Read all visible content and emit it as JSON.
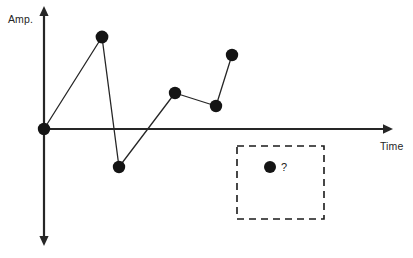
{
  "figure": {
    "name": "amplitude-time-sequence-diagram",
    "background_color": "#ffffff",
    "stroke_color": "#262626",
    "marker_color": "#141414",
    "width": 413,
    "height": 258
  },
  "axes": {
    "y": {
      "label": "Amp.",
      "label_x": 8,
      "label_y": 14,
      "x": 44,
      "top_y": 6,
      "bottom_y": 246,
      "arrow_up": true,
      "arrow_down": true
    },
    "x": {
      "label": "Time",
      "label_x": 380,
      "label_y": 141,
      "y": 129,
      "left_x": 44,
      "right_x": 393,
      "arrow_right": true
    }
  },
  "chart_data": {
    "type": "scatter",
    "title": "",
    "xlabel": "Time",
    "ylabel": "Amp.",
    "grid": false,
    "legend": null,
    "connected": true,
    "marker_radius": 6,
    "xlim": [
      44,
      393
    ],
    "ylim": [
      246,
      6
    ],
    "points": [
      {
        "name": "origin",
        "x": 44,
        "y": 129
      },
      {
        "name": "peak",
        "x": 102,
        "y": 37
      },
      {
        "name": "trough",
        "x": 119,
        "y": 167
      },
      {
        "name": "mid-high",
        "x": 175,
        "y": 93
      },
      {
        "name": "mid-low",
        "x": 216,
        "y": 106
      },
      {
        "name": "late-high",
        "x": 232,
        "y": 55
      }
    ],
    "polyline": [
      [
        44,
        129
      ],
      [
        102,
        37
      ],
      [
        119,
        167
      ],
      [
        175,
        93
      ],
      [
        216,
        106
      ],
      [
        232,
        55
      ]
    ],
    "annotations": [
      {
        "name": "unknown-point",
        "text": "?",
        "text_x": 281,
        "text_y": 162,
        "dot_x": 270,
        "dot_y": 167,
        "dot_radius": 6
      }
    ]
  },
  "highlight_box": {
    "name": "unknown-region",
    "style": "dashed",
    "x": 237,
    "y": 146,
    "width": 87,
    "height": 73,
    "stroke_color": "#1a1a1a",
    "stroke_width": 1.6,
    "dash_pattern": "7,5"
  }
}
